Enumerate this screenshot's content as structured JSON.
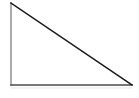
{
  "figure": {
    "name": "right-triangle",
    "shape_type": "triangle",
    "background_color": "#ffffff",
    "canvas": {
      "width": 139,
      "height": 98
    },
    "vertices": [
      {
        "label": "apex",
        "x": 11,
        "y": 3
      },
      {
        "label": "right-angle",
        "x": 11,
        "y": 85
      },
      {
        "label": "base-right",
        "x": 132,
        "y": 85
      }
    ],
    "edges": [
      {
        "name": "vertical-leg",
        "from": {
          "x": 11,
          "y": 3
        },
        "to": {
          "x": 11,
          "y": 85
        },
        "color": "#8a8a8a",
        "width": 1.4
      },
      {
        "name": "horizontal-leg",
        "from": {
          "x": 11,
          "y": 85
        },
        "to": {
          "x": 132,
          "y": 85
        },
        "color": "#4a4a4a",
        "width": 1.5
      },
      {
        "name": "hypotenuse",
        "from": {
          "x": 11,
          "y": 3
        },
        "to": {
          "x": 132,
          "y": 85
        },
        "color": "#1a1a1a",
        "width": 1.5
      }
    ],
    "shadow": {
      "name": "baseline-shadow",
      "from": {
        "x": 11,
        "y": 88
      },
      "to": {
        "x": 132,
        "y": 88
      },
      "color": "#e8e8e8",
      "width": 1.2
    },
    "polygon_points": "11,3 11,85 132,85"
  }
}
